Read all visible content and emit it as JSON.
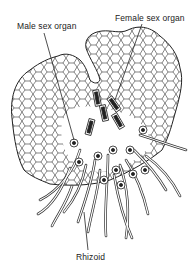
{
  "diagram": {
    "labels": {
      "male": "Male sex organ",
      "female": "Female sex organ",
      "rhizoid": "Rhizoid"
    },
    "colors": {
      "ink": "#222222",
      "background": "#ffffff"
    }
  }
}
